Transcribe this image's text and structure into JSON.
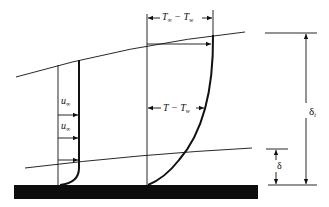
{
  "diagram": {
    "labels": {
      "temp_difference_freestream": {
        "main": "T",
        "sub1": "∞",
        "op": " − T",
        "sub2": "w"
      },
      "temp_difference_local": {
        "main": "T − T",
        "sub": "w"
      },
      "freestream_velocity_upper": {
        "main": "u",
        "sub": "∞"
      },
      "freestream_velocity_lower": {
        "main": "u",
        "sub": "∞"
      },
      "thermal_boundary_thickness": {
        "main": "δ",
        "sub": "t"
      },
      "velocity_boundary_thickness": {
        "main": "δ"
      }
    },
    "colors": {
      "line": "#111111",
      "plate": "#0d0d0d",
      "background": "#ffffff"
    }
  }
}
